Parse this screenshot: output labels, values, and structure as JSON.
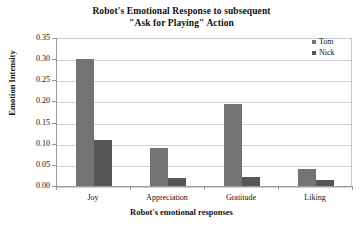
{
  "chart_data": {
    "type": "bar",
    "title": "Robot's Emotional Response to subsequent \"Ask for Playing\" Action",
    "title_lines": [
      "Robot's Emotional Response to subsequent",
      "\"Ask for Playing\" Action"
    ],
    "categories": [
      "Joy",
      "Appreciation",
      "Gratitude",
      "Liking"
    ],
    "series": [
      {
        "name": "Tom",
        "color": "#737373",
        "values": [
          0.3,
          0.09,
          0.195,
          0.04
        ]
      },
      {
        "name": "Nick",
        "color": "#565656",
        "values": [
          0.11,
          0.02,
          0.022,
          0.015
        ]
      }
    ],
    "xlabel": "Robot's emotional responses",
    "ylabel": "Emotion Intensity",
    "ylim": [
      0.0,
      0.35
    ],
    "ytick_labels": [
      "0.00",
      "0.05",
      "0.10",
      "0.15",
      "0.20",
      "0.25",
      "0.30",
      "0.35"
    ],
    "ytick_values": [
      0.0,
      0.05,
      0.1,
      0.15,
      0.2,
      0.25,
      0.3,
      0.35
    ],
    "grid": true,
    "legend_position": "top-right"
  }
}
